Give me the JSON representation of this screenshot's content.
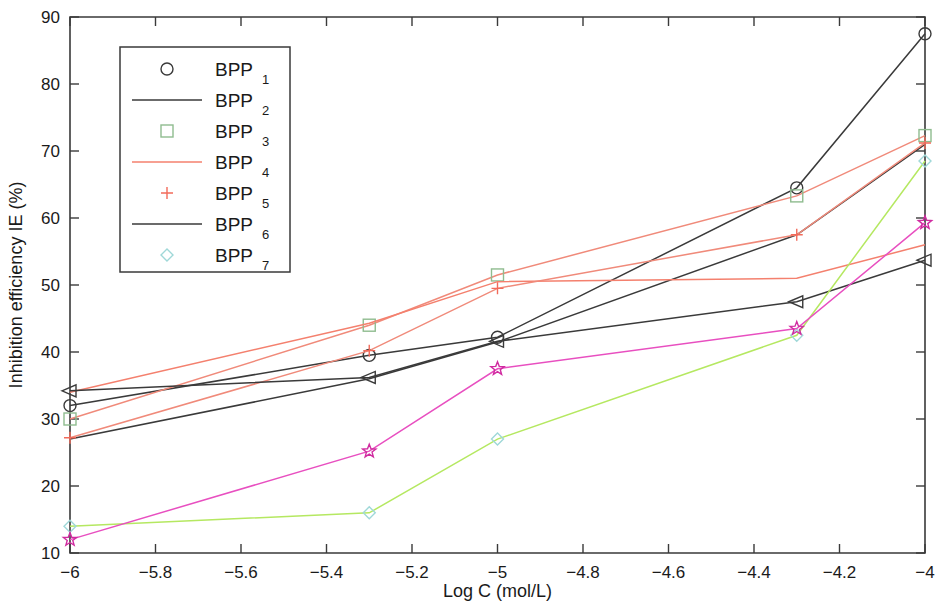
{
  "chart_data": {
    "type": "line",
    "title": "",
    "xlabel": "Log C (mol/L)",
    "ylabel": "Inhibition efficiency IE (%)",
    "xlim": [
      -6,
      -4
    ],
    "ylim": [
      10,
      90
    ],
    "xticks": [
      -6,
      -5.8,
      -5.6,
      -5.4,
      -5.2,
      -5,
      -4.8,
      -4.6,
      -4.4,
      -4.2,
      -4
    ],
    "xtick_labels": [
      "-6",
      "-5.8",
      "-5.6",
      "-5.4",
      "-5.2",
      "-5",
      "-4.8",
      "-4.6",
      "-4.4",
      "-4.2",
      "-4"
    ],
    "yticks": [
      10,
      20,
      30,
      40,
      50,
      60,
      70,
      80,
      90
    ],
    "ytick_labels": [
      "10",
      "20",
      "30",
      "40",
      "50",
      "60",
      "70",
      "80",
      "90"
    ],
    "grid": false,
    "legend_position": "upper-left",
    "x": [
      -6,
      -5.3,
      -5,
      -4.3,
      -4
    ],
    "series": [
      {
        "name": "BPP1",
        "label_base": "BPP",
        "label_sub": "1",
        "marker": "circle",
        "color": "#3a3a3a",
        "marker_color": "#3a3a3a",
        "values": [
          32.0,
          39.5,
          42.2,
          64.5,
          87.5
        ]
      },
      {
        "name": "BPP2",
        "label_base": "BPP",
        "label_sub": "2",
        "marker": "none",
        "color": "#3a3a3a",
        "marker_color": "#3a3a3a",
        "values": [
          27.0,
          36.0,
          41.5,
          57.5,
          71.0
        ]
      },
      {
        "name": "BPP3",
        "label_base": "BPP",
        "label_sub": "3",
        "marker": "square",
        "color": "#f08a7a",
        "marker_color": "#8fbc8f",
        "values": [
          30.0,
          44.0,
          51.5,
          63.3,
          72.3
        ]
      },
      {
        "name": "BPP4",
        "label_base": "BPP",
        "label_sub": "4",
        "marker": "none",
        "color": "#f4806e",
        "marker_color": "#f4806e",
        "values": [
          34.0,
          44.3,
          50.5,
          51.0,
          56.0
        ]
      },
      {
        "name": "BPP5",
        "label_base": "BPP",
        "label_sub": "5",
        "marker": "plus",
        "color": "#f08a7a",
        "marker_color": "#f26b5b",
        "values": [
          27.2,
          40.2,
          49.5,
          57.5,
          71.2
        ]
      },
      {
        "name": "BPP6",
        "label_base": "BPP",
        "label_sub": "6",
        "marker": "triangle-left",
        "color": "#3a3a3a",
        "marker_color": "#3a3a3a",
        "values": [
          34.2,
          36.2,
          41.6,
          47.5,
          53.7
        ]
      },
      {
        "name": "BPP7",
        "label_base": "BPP",
        "label_sub": "7",
        "marker": "diamond",
        "color": "#b5e861",
        "marker_color": "#9fd8d8",
        "values": [
          14.0,
          16.0,
          27.0,
          42.5,
          68.5
        ]
      },
      {
        "name": "BPP-star",
        "label_base": "BPP",
        "label_sub": "5",
        "marker": "star",
        "color": "#e84fc0",
        "marker_color": "#d02ba0",
        "values": [
          12.0,
          25.2,
          37.5,
          43.5,
          59.3
        ]
      }
    ],
    "legend_entries": [
      {
        "label_base": "BPP",
        "label_sub": "1",
        "marker": "circle",
        "line": false,
        "color": "#3a3a3a"
      },
      {
        "label_base": "BPP",
        "label_sub": "2",
        "marker": "none",
        "line": true,
        "color": "#3a3a3a"
      },
      {
        "label_base": "BPP",
        "label_sub": "3",
        "marker": "square",
        "line": false,
        "color": "#8fbc8f"
      },
      {
        "label_base": "BPP",
        "label_sub": "4",
        "marker": "none",
        "line": true,
        "color": "#f4806e"
      },
      {
        "label_base": "BPP",
        "label_sub": "5",
        "marker": "plus",
        "line": false,
        "color": "#f26b5b"
      },
      {
        "label_base": "BPP",
        "label_sub": "6",
        "marker": "none",
        "line": true,
        "color": "#3a3a3a"
      },
      {
        "label_base": "BPP",
        "label_sub": "7",
        "marker": "diamond",
        "line": false,
        "color": "#9fd8d8"
      }
    ]
  }
}
